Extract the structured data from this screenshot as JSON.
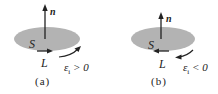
{
  "colors": {
    "disc": "#b3b3b3",
    "ink": "#222222"
  },
  "panels": [
    {
      "id": "a",
      "normal_label": "n",
      "surface_label": "S",
      "loop_label": "L",
      "emf_symbol": "ε",
      "emf_sub": "i",
      "emf_relation": " > 0",
      "caption": "(a)",
      "loop_arrow_direction": "right",
      "emf_arrow_direction": "counterclockwise"
    },
    {
      "id": "b",
      "normal_label": "n",
      "surface_label": "S",
      "loop_label": "L",
      "emf_symbol": "ε",
      "emf_sub": "i",
      "emf_relation": " < 0",
      "caption": "(b)",
      "loop_arrow_direction": "left",
      "emf_arrow_direction": "clockwise"
    }
  ]
}
